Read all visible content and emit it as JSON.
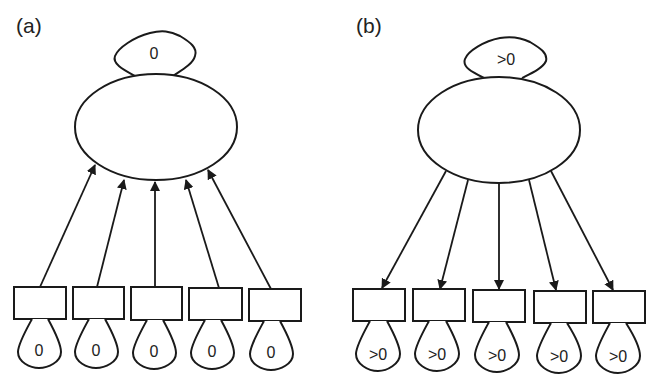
{
  "panels": [
    {
      "label": "(a)",
      "latent_variance": "0",
      "arrow_direction": "indicators-to-latent",
      "indicators": [
        {
          "error_variance": "0"
        },
        {
          "error_variance": "0"
        },
        {
          "error_variance": "0"
        },
        {
          "error_variance": "0"
        },
        {
          "error_variance": "0"
        }
      ]
    },
    {
      "label": "(b)",
      "latent_variance": ">0",
      "arrow_direction": "latent-to-indicators",
      "indicators": [
        {
          "error_variance": ">0"
        },
        {
          "error_variance": ">0"
        },
        {
          "error_variance": ">0"
        },
        {
          "error_variance": ">0"
        },
        {
          "error_variance": ">0"
        }
      ]
    }
  ],
  "colors": {
    "stroke": "#1a1a1a",
    "background": "#ffffff"
  }
}
